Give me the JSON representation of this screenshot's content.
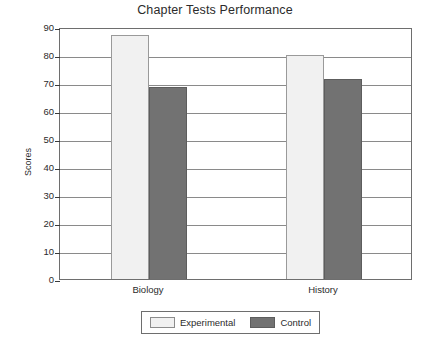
{
  "chart_data": {
    "type": "bar",
    "title": "Chapter Tests Performance",
    "xlabel": "",
    "ylabel": "Scores",
    "categories": [
      "Biology",
      "History"
    ],
    "series": [
      {
        "name": "Experimental",
        "values": [
          87,
          80
        ],
        "color": "#f1f1f1"
      },
      {
        "name": "Control",
        "values": [
          68.5,
          71.5
        ],
        "color": "#727272"
      }
    ],
    "ylim": [
      0,
      90
    ],
    "ytick_step": 10,
    "ytick_labels": [
      "90",
      "80",
      "70",
      "60",
      "50",
      "40",
      "30",
      "20",
      "10",
      "0"
    ],
    "ytick_values": [
      90,
      80,
      70,
      60,
      50,
      40,
      30,
      20,
      10,
      0
    ],
    "grid": true,
    "grid_axis": "y",
    "legend_position": "bottom-center",
    "legend_entries": [
      "Experimental",
      "Control"
    ]
  },
  "colors": {
    "axis": "#6e6e6e",
    "grid": "#8a8a8a",
    "text": "#2b2b2b",
    "experimental": "#f1f1f1",
    "control": "#727272",
    "background": "#ffffff"
  }
}
